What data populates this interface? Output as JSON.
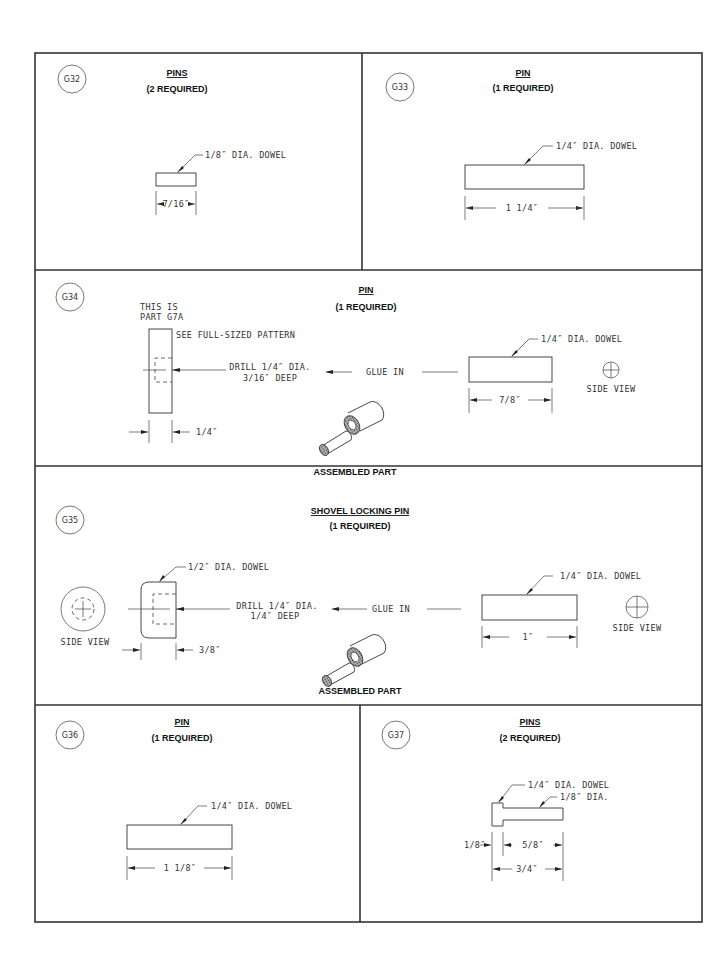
{
  "sheet": {
    "panels": [
      {
        "id": "G32",
        "title": "PINS",
        "quantity": "(2 REQUIRED)",
        "callout": "1/8″ DIA. DOWEL",
        "dimension": "7/16″"
      },
      {
        "id": "G33",
        "title": "PIN",
        "quantity": "(1 REQUIRED)",
        "callout": "1/4″ DIA. DOWEL",
        "dimension": "1 1/4″"
      },
      {
        "id": "G34",
        "title": "PIN",
        "quantity": "(1 REQUIRED)",
        "note_line1": "THIS IS",
        "note_line2": "PART G7A",
        "pattern_note": "SEE FULL-SIZED PATTERN",
        "drill_line1": "DRILL 1/4″ DIA.",
        "drill_line2": "3/16″ DEEP",
        "glue_label": "GLUE IN",
        "callout": "1/4″ DIA. DOWEL",
        "dimension_pin": "7/8″",
        "dimension_part": "1/4″",
        "side_view_label": "SIDE VIEW",
        "assembled_label": "ASSEMBLED PART"
      },
      {
        "id": "G35",
        "title": "SHOVEL LOCKING PIN",
        "quantity": "(1 REQUIRED)",
        "part_callout": "1/2″ DIA. DOWEL",
        "drill_line1": "DRILL 1/4″ DIA.",
        "drill_line2": "1/4″ DEEP",
        "glue_label": "GLUE IN",
        "callout": "1/4″ DIA. DOWEL",
        "dimension_pin": "1″",
        "dimension_part": "3/8″",
        "side_view_left_label": "SIDE VIEW",
        "side_view_right_label": "SIDE VIEW",
        "assembled_label": "ASSEMBLED PART"
      },
      {
        "id": "G36",
        "title": "PIN",
        "quantity": "(1 REQUIRED)",
        "callout": "1/4″ DIA. DOWEL",
        "dimension": "1 1/8″"
      },
      {
        "id": "G37",
        "title": "PINS",
        "quantity": "(2 REQUIRED)",
        "callout_head": "1/4″ DIA. DOWEL",
        "callout_shaft": "1/8″ DIA.",
        "dimension_head": "1/8″",
        "dimension_shaft": "5/8″",
        "dimension_total": "3/4″"
      }
    ]
  }
}
